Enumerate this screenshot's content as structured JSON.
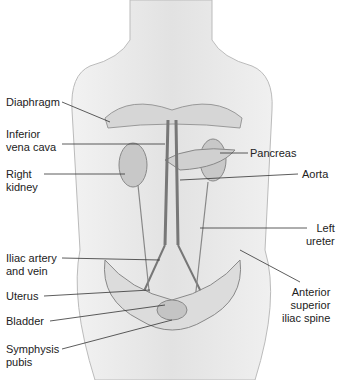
{
  "figure": {
    "labels_left": [
      {
        "text": "Diaphragm",
        "x": 6,
        "y": 96
      },
      {
        "text": "Inferior\nvena cava",
        "x": 6,
        "y": 128
      },
      {
        "text": "Right\nkidney",
        "x": 6,
        "y": 168
      },
      {
        "text": "Iliac artery\nand vein",
        "x": 6,
        "y": 252
      },
      {
        "text": "Uterus",
        "x": 6,
        "y": 290
      },
      {
        "text": "Bladder",
        "x": 6,
        "y": 315
      },
      {
        "text": "Symphysis\npubis",
        "x": 6,
        "y": 343
      }
    ],
    "labels_right": [
      {
        "text": "Pancreas",
        "x": 250,
        "y": 147
      },
      {
        "text": "Aorta",
        "x": 302,
        "y": 168
      },
      {
        "text": "Left\nureter",
        "x": 310,
        "y": 222
      },
      {
        "text": "Anterior\nsuperior\niliac spine",
        "x": 282,
        "y": 286
      }
    ]
  }
}
